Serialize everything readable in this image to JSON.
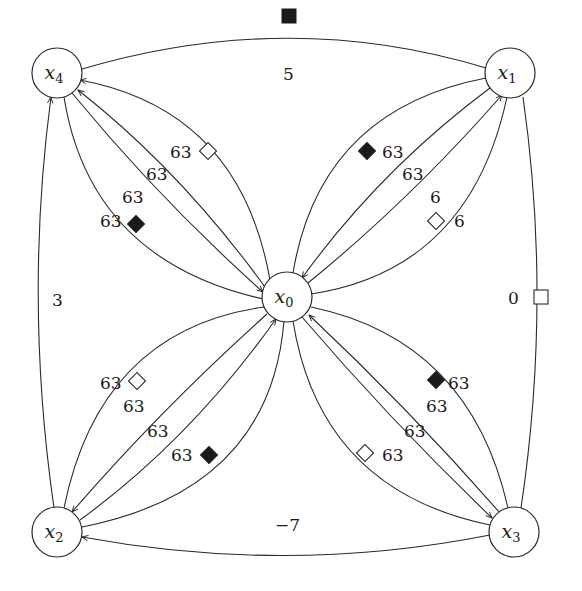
{
  "diagram": {
    "type": "directed-weighted-graph",
    "nodes": [
      {
        "id": "x0",
        "label": "x",
        "sub": "0",
        "cx": 287,
        "cy": 297
      },
      {
        "id": "x1",
        "label": "x",
        "sub": "1",
        "cx": 510,
        "cy": 73
      },
      {
        "id": "x2",
        "label": "x",
        "sub": "2",
        "cx": 57,
        "cy": 532
      },
      {
        "id": "x3",
        "label": "x",
        "sub": "3",
        "cx": 514,
        "cy": 532
      },
      {
        "id": "x4",
        "label": "x",
        "sub": "4",
        "cx": 57,
        "cy": 73
      }
    ],
    "outer_edges": {
      "top": {
        "from": "x4",
        "to": "x1",
        "weight": "5",
        "marker": "black-square"
      },
      "right": {
        "from": "x1",
        "to": "x3",
        "weight": "0",
        "marker": "white-square"
      },
      "left": {
        "from": "x2",
        "to": "x4",
        "weight": "3",
        "marker": "none"
      },
      "bottom": {
        "from": "x3",
        "to": "x2",
        "weight": "−7",
        "marker": "none"
      }
    },
    "bundles": {
      "x0_x4": {
        "weights": [
          "63",
          "63",
          "63",
          "63"
        ],
        "markers": [
          "white-diamond",
          "none",
          "none",
          "black-diamond"
        ]
      },
      "x0_x1": {
        "weights": [
          "63",
          "63",
          "6",
          "6"
        ],
        "markers": [
          "black-diamond",
          "none",
          "none",
          "white-diamond"
        ]
      },
      "x0_x2": {
        "weights": [
          "63",
          "63",
          "63",
          "63"
        ],
        "markers": [
          "white-diamond",
          "none",
          "none",
          "black-diamond"
        ]
      },
      "x0_x3": {
        "weights": [
          "63",
          "63",
          "63",
          "63"
        ],
        "markers": [
          "black-diamond",
          "none",
          "none",
          "white-diamond"
        ]
      }
    }
  }
}
